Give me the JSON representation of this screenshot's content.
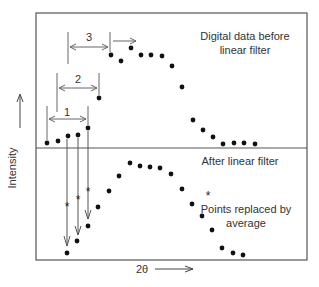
{
  "diagram": {
    "y_axis_label": "Intensity",
    "x_axis_label": "2θ",
    "top_panel": {
      "label_line1": "Digital data before",
      "label_line2": "linear filter",
      "window_labels": [
        "1",
        "2",
        "3"
      ],
      "points": [
        [
          47,
          143
        ],
        [
          58,
          141
        ],
        [
          68,
          136
        ],
        [
          78,
          135
        ],
        [
          88,
          128
        ],
        [
          99,
          98
        ],
        [
          111,
          55
        ],
        [
          121,
          61
        ],
        [
          131,
          48
        ],
        [
          141,
          55
        ],
        [
          151,
          55
        ],
        [
          162,
          56
        ],
        [
          172,
          66
        ],
        [
          182,
          87
        ],
        [
          193,
          120
        ],
        [
          203,
          130
        ],
        [
          213,
          137
        ],
        [
          223,
          144
        ],
        [
          234,
          143
        ],
        [
          244,
          143
        ],
        [
          255,
          144
        ]
      ]
    },
    "bottom_panel": {
      "label": "After linear filter",
      "legend_symbol": "*",
      "legend_line1": "Points replaced by",
      "legend_line2": "average",
      "points": [
        [
          67,
          253
        ],
        [
          77,
          241
        ],
        [
          88,
          226
        ],
        [
          98,
          207
        ],
        [
          109,
          191
        ],
        [
          119,
          176
        ],
        [
          130,
          163
        ],
        [
          140,
          166
        ],
        [
          150,
          167
        ],
        [
          160,
          168
        ],
        [
          171,
          174
        ],
        [
          182,
          189
        ],
        [
          192,
          204
        ],
        [
          202,
          216
        ],
        [
          212,
          230
        ],
        [
          222,
          248
        ],
        [
          233,
          253
        ],
        [
          243,
          255
        ]
      ]
    },
    "colors": {
      "ink": "#222222",
      "frame": "#555555",
      "arrow": "#777777"
    }
  }
}
